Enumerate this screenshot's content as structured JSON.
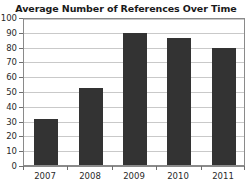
{
  "chart_data": {
    "type": "bar",
    "title": "Average Number of References Over Time",
    "xlabel": "",
    "ylabel": "",
    "categories": [
      "2007",
      "2008",
      "2009",
      "2010",
      "2011"
    ],
    "values": [
      31,
      52,
      89,
      86,
      79
    ],
    "ylim": [
      0,
      100
    ],
    "ytick_step": 10,
    "yticks": [
      "0",
      "10",
      "20",
      "30",
      "40",
      "50",
      "60",
      "70",
      "80",
      "90",
      "100"
    ],
    "grid": true,
    "grid_axis": "y",
    "legend": false,
    "legend_position": "none",
    "series": [
      {
        "name": "Average Number of References",
        "values": [
          31,
          52,
          89,
          86,
          79
        ]
      }
    ],
    "colors": {
      "bar": "#333333",
      "grid": "#c9c9c9",
      "axis": "#8a8a8a",
      "text": "#2a2a2a",
      "title": "#1a1a1a",
      "background": "#ffffff"
    }
  }
}
